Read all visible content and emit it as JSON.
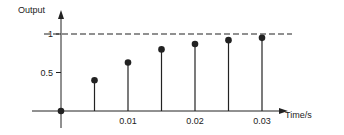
{
  "chart_data": {
    "type": "stem",
    "title": "",
    "xlabel": "Time/s",
    "ylabel": "Output",
    "x": [
      0,
      0.005,
      0.01,
      0.015,
      0.02,
      0.025,
      0.03
    ],
    "values": [
      0,
      0.4,
      0.63,
      0.8,
      0.87,
      0.92,
      0.95
    ],
    "x_ticks": [
      "0.01",
      "0.02",
      "0.03"
    ],
    "x_tick_values": [
      0.01,
      0.02,
      0.03
    ],
    "y_ticks": [
      "0.5",
      "1"
    ],
    "y_tick_values": [
      0.5,
      1
    ],
    "reference_line": {
      "y": 1,
      "style": "dashed"
    },
    "xlim": [
      0,
      0.033
    ],
    "ylim": [
      0,
      1.1
    ],
    "grid": false,
    "legend": null
  },
  "colors": {
    "ink": "#222222",
    "background": "#ffffff"
  }
}
